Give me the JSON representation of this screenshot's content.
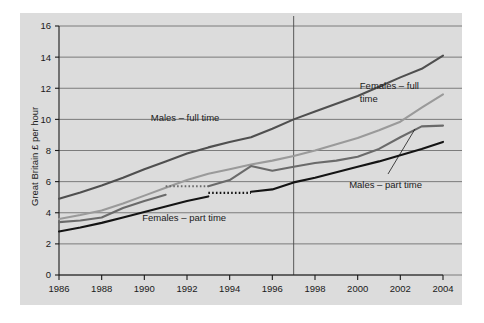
{
  "chart_data": {
    "type": "line",
    "title": "",
    "xlabel": "",
    "ylabel": "Great Britain £ per hour",
    "xlim": [
      1986,
      2004
    ],
    "ylim": [
      0,
      16
    ],
    "ytick_labels": [
      "0",
      "2",
      "4",
      "6",
      "8",
      "10",
      "12",
      "14",
      "16"
    ],
    "yticks": [
      0,
      2,
      4,
      6,
      8,
      10,
      12,
      14,
      16
    ],
    "xtick_labels": [
      "1986",
      "1988",
      "1990",
      "1992",
      "1994",
      "1996",
      "1998",
      "2000",
      "2002",
      "2004"
    ],
    "xticks": [
      1986,
      1988,
      1990,
      1992,
      1994,
      1996,
      1998,
      2000,
      2002,
      2004
    ],
    "grid": true,
    "legend_position": "inline-annotations",
    "x": [
      1986,
      1987,
      1988,
      1989,
      1990,
      1991,
      1992,
      1993,
      1994,
      1995,
      1996,
      1997,
      1998,
      1999,
      2000,
      2001,
      2002,
      2003,
      2004
    ],
    "series": [
      {
        "name": "Males – full time",
        "color": "#4f4f4f",
        "label_text": "Males – full time",
        "values": [
          4.9,
          5.3,
          5.75,
          6.25,
          6.8,
          7.3,
          7.8,
          8.2,
          8.55,
          8.85,
          9.4,
          10.0,
          10.5,
          11.0,
          11.5,
          12.1,
          12.7,
          13.25,
          14.1
        ]
      },
      {
        "name": "Females – full time",
        "color": "#9a9a9a",
        "label_text": "Females – full time",
        "values": [
          3.6,
          3.85,
          4.15,
          4.6,
          5.1,
          5.6,
          6.1,
          6.5,
          6.8,
          7.1,
          7.35,
          7.65,
          8.0,
          8.4,
          8.8,
          9.3,
          9.85,
          10.75,
          11.6
        ]
      },
      {
        "name": "Males – part time",
        "color": "#6a6a6a",
        "label_text": "Males – part time",
        "values": [
          3.4,
          3.5,
          3.7,
          4.3,
          4.75,
          5.15,
          5.5,
          5.7,
          6.1,
          7.0,
          6.7,
          6.95,
          7.2,
          7.35,
          7.6,
          8.1,
          8.85,
          9.55,
          9.6
        ],
        "gap_segment": {
          "from_index": 5,
          "to_index": 7,
          "value": 5.7
        }
      },
      {
        "name": "Females – part time",
        "color": "#141414",
        "label_text": "Females – part time",
        "values": [
          2.8,
          3.05,
          3.35,
          3.7,
          4.05,
          4.4,
          4.75,
          5.05,
          5.2,
          5.35,
          5.5,
          5.95,
          6.25,
          6.6,
          6.95,
          7.3,
          7.7,
          8.1,
          8.55
        ],
        "gap_segment": {
          "from_index": 7,
          "to_index": 9,
          "value": 5.28
        }
      }
    ],
    "reference_line": {
      "x": 1997,
      "label": ""
    },
    "annotations": [
      {
        "id": "males-full-time",
        "text": "Males – full time",
        "x": 1990.3,
        "y": 9.9
      },
      {
        "id": "females-full-time-line1",
        "text": "Females – full",
        "x": 2000.1,
        "y": 11.95
      },
      {
        "id": "females-full-time-line2",
        "text": "time",
        "x": 2000.1,
        "y": 11.1
      },
      {
        "id": "males-part-time",
        "text": "Males – part time",
        "x": 1999.6,
        "y": 5.6
      },
      {
        "id": "females-part-time",
        "text": "Females – part time",
        "x": 1989.9,
        "y": 3.45
      }
    ]
  },
  "figure": {
    "background_color": "#ffffff",
    "panel_color": "#dcdcdc",
    "gridline_color": "#6f6f6f",
    "axis_color": "#1a1a1a"
  }
}
